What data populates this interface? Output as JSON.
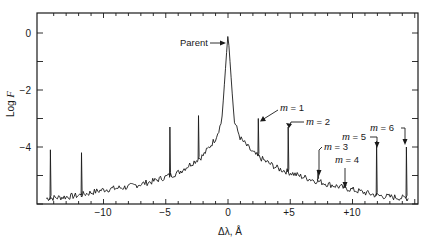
{
  "chart_data": {
    "type": "line",
    "title": "",
    "xlabel": "Δλ, Å",
    "ylabel": "Log F",
    "xlim": [
      -15.0,
      15.6
    ],
    "ylim": [
      -6.0,
      0.7
    ],
    "x_ticks": [
      -10,
      -5,
      0,
      5,
      10
    ],
    "x_tick_labels": [
      "−10",
      "−5",
      "0",
      "+5",
      "+10"
    ],
    "y_ticks": [
      0,
      -2,
      -4
    ],
    "y_tick_labels": [
      "0",
      "−2",
      "−4"
    ],
    "grid": false,
    "legend": null,
    "baseline_profile": {
      "x": [
        -14.5,
        -13,
        -12,
        -11,
        -10,
        -8,
        -6,
        -4,
        -3,
        -2,
        -1,
        -0.5,
        0,
        0.5,
        1,
        2,
        3,
        4,
        6,
        8,
        10,
        11,
        12,
        13,
        14.5
      ],
      "y": [
        -5.8,
        -5.75,
        -5.7,
        -5.6,
        -5.5,
        -5.4,
        -5.2,
        -4.9,
        -4.6,
        -4.3,
        -3.7,
        -3.1,
        0.0,
        -3.1,
        -3.7,
        -4.2,
        -4.5,
        -4.75,
        -5.05,
        -5.3,
        -5.5,
        -5.6,
        -5.7,
        -5.75,
        -5.8
      ]
    },
    "peaks": [
      {
        "x": -14.3,
        "y": -4.1,
        "label": ""
      },
      {
        "x": -11.8,
        "y": -4.2,
        "label": ""
      },
      {
        "x": -4.7,
        "y": -3.3,
        "label": ""
      },
      {
        "x": -2.4,
        "y": -2.9,
        "label": ""
      },
      {
        "x": 0.0,
        "y": 0.0,
        "label": "Parent"
      },
      {
        "x": 2.4,
        "y": -3.0,
        "label": "m = 1"
      },
      {
        "x": 4.8,
        "y": -3.3,
        "label": "m = 2"
      },
      {
        "x": 7.2,
        "y": -4.8,
        "label": "m = 3"
      },
      {
        "x": 9.4,
        "y": -5.3,
        "label": "m = 4"
      },
      {
        "x": 11.9,
        "y": -3.8,
        "label": "m = 5"
      },
      {
        "x": 14.3,
        "y": -4.0,
        "label": "m = 6"
      }
    ],
    "annotations": [
      {
        "text": "Parent",
        "x": 0.0,
        "y": 0.0
      },
      {
        "text": "m = 1",
        "x": 2.4,
        "y": -3.0
      },
      {
        "text": "m = 2",
        "x": 4.8,
        "y": -3.3
      },
      {
        "text": "m = 3",
        "x": 7.2,
        "y": -4.8
      },
      {
        "text": "m = 4",
        "x": 9.4,
        "y": -5.3
      },
      {
        "text": "m = 5",
        "x": 11.9,
        "y": -3.8
      },
      {
        "text": "m = 6",
        "x": 14.3,
        "y": -4.0
      }
    ]
  },
  "labels": {
    "ylabel_prefix": "Log ",
    "ylabel_var": "F",
    "xlabel": "Δλ, Å",
    "parent": "Parent",
    "m_var": "m",
    "m1": " = 1",
    "m2": " = 2",
    "m3": " = 3",
    "m4": " = 4",
    "m5": " = 5",
    "m6": " = 6"
  }
}
